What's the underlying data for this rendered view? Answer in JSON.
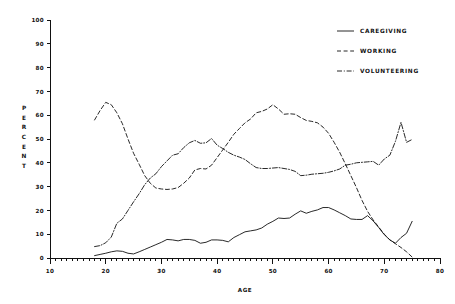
{
  "chart_data": {
    "type": "line",
    "title": "",
    "xlabel": "AGE",
    "ylabel": "PERCENT",
    "xlim": [
      10,
      80
    ],
    "ylim": [
      0,
      100
    ],
    "xticks": [
      10,
      20,
      30,
      40,
      50,
      60,
      70,
      80
    ],
    "yticks": [
      0,
      10,
      20,
      30,
      40,
      50,
      60,
      70,
      80,
      90,
      100
    ],
    "xtick_minor_step": 1,
    "grid": false,
    "legend_position": "top-right",
    "series": [
      {
        "name": "CAREGIVING",
        "style": "solid",
        "x": [
          18,
          19,
          20,
          21,
          22,
          23,
          24,
          25,
          26,
          27,
          28,
          29,
          30,
          31,
          32,
          33,
          34,
          35,
          36,
          37,
          38,
          39,
          40,
          41,
          42,
          43,
          44,
          45,
          46,
          47,
          48,
          49,
          50,
          51,
          52,
          53,
          54,
          55,
          56,
          57,
          58,
          59,
          60,
          61,
          62,
          63,
          64,
          65,
          66,
          67,
          68,
          69,
          70,
          71,
          72,
          73,
          74,
          75
        ],
        "values": [
          1,
          1.5,
          2,
          2.6,
          3,
          2.8,
          2,
          1.7,
          2.6,
          3.6,
          4.6,
          5.6,
          6.6,
          7.8,
          7.6,
          7.2,
          7.8,
          7.8,
          7.4,
          6.2,
          6.6,
          7.6,
          7.6,
          7.4,
          6.8,
          8.6,
          9.8,
          11,
          11.4,
          11.8,
          12.6,
          14.2,
          15.4,
          16.8,
          16.6,
          16.8,
          18.4,
          19.8,
          18.8,
          19.6,
          20.2,
          21.2,
          21.2,
          20.2,
          19,
          17.8,
          16.4,
          16.2,
          16.2,
          17.8,
          15.6,
          12.8,
          9.8,
          7.6,
          6.2,
          8.6,
          10.4,
          15.4
        ]
      },
      {
        "name": "WORKING",
        "style": "dashed",
        "x": [
          18,
          19,
          20,
          21,
          22,
          23,
          24,
          25,
          26,
          27,
          28,
          29,
          30,
          31,
          32,
          33,
          34,
          35,
          36,
          37,
          38,
          39,
          40,
          41,
          42,
          43,
          44,
          45,
          46,
          47,
          48,
          49,
          50,
          51,
          52,
          53,
          54,
          55,
          56,
          57,
          58,
          59,
          60,
          61,
          62,
          63,
          64,
          65,
          66,
          67,
          68,
          69,
          70,
          71,
          72,
          73,
          74,
          75
        ],
        "values": [
          58,
          62,
          65.4,
          64.4,
          61,
          56.4,
          50,
          44,
          39.4,
          34.6,
          31.4,
          29.4,
          29,
          28.8,
          29,
          29.6,
          31.4,
          33.6,
          37,
          37.6,
          37.4,
          39,
          42.2,
          45.4,
          48.6,
          52,
          54.4,
          56.8,
          58.4,
          61,
          61.6,
          62.6,
          64.4,
          62.6,
          60.4,
          60.6,
          60.4,
          59,
          57.8,
          57.4,
          56.8,
          55,
          52.4,
          48.6,
          44.4,
          39.6,
          34.6,
          29.6,
          24.2,
          19.6,
          16,
          13,
          10,
          7.6,
          6,
          4.4,
          2.6,
          0.4
        ]
      },
      {
        "name": "VOLUNTEERING",
        "style": "dash-dot",
        "x": [
          18,
          19,
          20,
          21,
          22,
          23,
          24,
          25,
          26,
          27,
          28,
          29,
          30,
          31,
          32,
          33,
          34,
          35,
          36,
          37,
          38,
          39,
          40,
          41,
          42,
          43,
          44,
          45,
          46,
          47,
          48,
          49,
          50,
          51,
          52,
          53,
          54,
          55,
          56,
          57,
          58,
          59,
          60,
          61,
          62,
          63,
          64,
          65,
          66,
          67,
          68,
          69,
          70,
          71,
          72,
          73,
          74,
          75
        ],
        "values": [
          4.8,
          5.2,
          6.4,
          8.8,
          14.6,
          16.4,
          20,
          23.6,
          27,
          30.8,
          33.6,
          35.4,
          38.4,
          40.8,
          43.2,
          43.8,
          46.4,
          48.4,
          49.4,
          48.2,
          48.4,
          50.2,
          47.4,
          46,
          44.4,
          43.2,
          42.4,
          41.4,
          39.6,
          38,
          37.6,
          37.6,
          37.8,
          38,
          37.6,
          37.2,
          36.4,
          34.6,
          34.8,
          35.2,
          35.4,
          35.6,
          36,
          36.6,
          37.4,
          39,
          39.4,
          40,
          40.2,
          40.4,
          40.6,
          39,
          41.6,
          43.2,
          49,
          57,
          48.6,
          49.8
        ]
      }
    ],
    "legend": [
      {
        "label": "CAREGIVING",
        "style": "solid"
      },
      {
        "label": "WORKING",
        "style": "dashed"
      },
      {
        "label": "VOLUNTEERING",
        "style": "dash-dot"
      }
    ]
  }
}
